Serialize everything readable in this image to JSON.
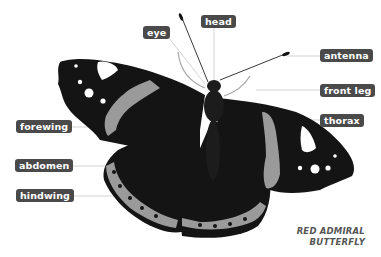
{
  "diagram": {
    "caption": {
      "line1": "RED ADMIRAL",
      "line2": "BUTTERFLY"
    },
    "labels": {
      "eye": "eye",
      "head": "head",
      "antenna": "antenna",
      "front_leg": "front leg",
      "thorax": "thorax",
      "forewing": "forewing",
      "abdomen": "abdomen",
      "hindwing": "hindwing"
    },
    "colors": {
      "label_bg": "#4a4a4a",
      "label_text": "#ffffff",
      "leader_line": "#c8c8c8",
      "wing_dark": "#141414",
      "wing_band": "#9a9a9a",
      "wing_spot": "#ffffff",
      "caption_text": "#555555"
    }
  }
}
